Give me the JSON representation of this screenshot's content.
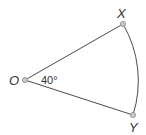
{
  "diagram": {
    "type": "sector",
    "points": {
      "O": {
        "label": "O",
        "x": 25,
        "y": 80
      },
      "X": {
        "label": "X",
        "x": 123,
        "y": 24
      },
      "Y": {
        "label": "Y",
        "x": 133,
        "y": 115
      }
    },
    "angle_label": "40°",
    "colors": {
      "stroke": "#4a4a4a",
      "point_fill": "#c8c8c8",
      "point_stroke": "#8a8a8a",
      "text": "#333333"
    }
  }
}
